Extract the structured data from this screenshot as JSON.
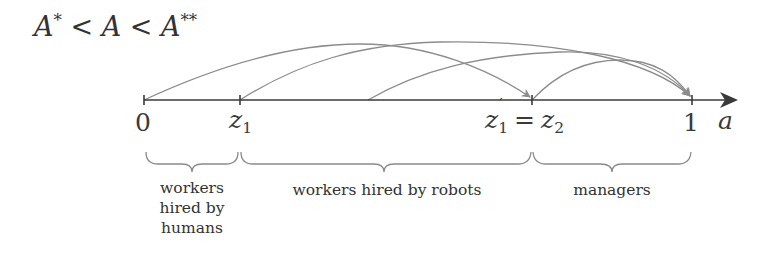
{
  "title": {
    "condition": "A* < A < A**",
    "parts": [
      "A",
      "*",
      " < ",
      "A",
      " < ",
      "A",
      "**"
    ]
  },
  "axis": {
    "variable": "a",
    "ticks": [
      {
        "id": "zero",
        "label": "0",
        "x": 144
      },
      {
        "id": "z1",
        "label_base": "z",
        "label_sub": "1",
        "x": 240
      },
      {
        "id": "z1prime_eq_z2",
        "label": "z1' = z2",
        "x": 532
      },
      {
        "id": "one",
        "label": "1",
        "x": 692
      }
    ]
  },
  "arcs": [
    {
      "from": "0",
      "to": "z1' = z2"
    },
    {
      "from": "z1",
      "to": "1"
    },
    {
      "from": "interior point between z1 and z1'",
      "to": "1"
    },
    {
      "from": "z1' = z2",
      "to": "1"
    }
  ],
  "regions": [
    {
      "id": "humans",
      "label_lines": [
        "workers",
        "hired by",
        "humans"
      ],
      "range": [
        "0",
        "z1"
      ]
    },
    {
      "id": "robots",
      "label": "workers hired by robots",
      "range": [
        "z1",
        "z1' = z2"
      ]
    },
    {
      "id": "managers",
      "label": "managers",
      "range": [
        "z2",
        "1"
      ]
    }
  ],
  "colors": {
    "axis": "#3a3a3a",
    "arc": "#8c8c8c",
    "text": "#333333"
  }
}
